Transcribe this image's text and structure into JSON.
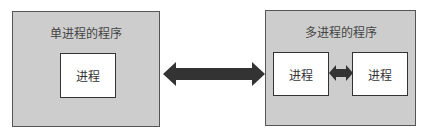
{
  "left_panel": {
    "title": "单进程的程序",
    "process": "进程"
  },
  "right_panel": {
    "title": "多进程的程序",
    "processes": [
      "进程",
      "进程"
    ]
  },
  "colors": {
    "panel_bg": "#cdcdcd",
    "arrow": "#333333",
    "box_bg": "#ffffff"
  }
}
